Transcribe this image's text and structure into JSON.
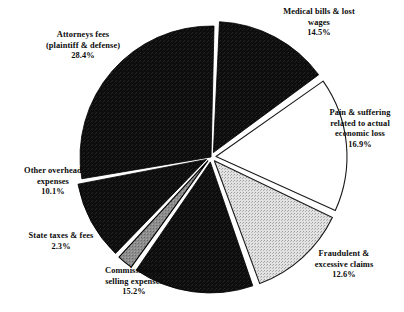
{
  "chart_data": {
    "type": "pie",
    "title": "",
    "subtitle": "",
    "xlabel": "",
    "ylabel": "",
    "legend_position": "none",
    "grid": false,
    "units": "percent",
    "total": 100.0,
    "categories": [
      "Medical bills & lost wages",
      "Pain & suffering related to actual economic loss",
      "Fraudulent & excessive claims",
      "Commissions & selling expenses",
      "State taxes & fees",
      "Other overhead expenses",
      "Attorneys fees (plaintiff & defense)"
    ],
    "values": [
      14.5,
      16.9,
      12.6,
      15.2,
      2.3,
      10.1,
      28.4
    ],
    "slices": [
      {
        "key": "medical",
        "label_lines": [
          "Medical bills & lost",
          "wages"
        ],
        "value_text": "14.5%",
        "value": 14.5,
        "fill_style": "black",
        "fill": "#0d0d0d",
        "stroke": "#000000",
        "exploded": true
      },
      {
        "key": "pain",
        "label_lines": [
          "Pain & suffering",
          "related to actual",
          "economic loss"
        ],
        "value_text": "16.9%",
        "value": 16.9,
        "fill_style": "white",
        "fill": "#ffffff",
        "stroke": "#1a1a1a",
        "exploded": true
      },
      {
        "key": "fraudulent",
        "label_lines": [
          "Fraudulent &",
          "excessive claims"
        ],
        "value_text": "12.6%",
        "value": 12.6,
        "fill_style": "light-stipple",
        "fill": "#dcdcdc",
        "stroke": "#1a1a1a",
        "exploded": true
      },
      {
        "key": "commissions",
        "label_lines": [
          "Commissions &",
          "selling expenses"
        ],
        "value_text": "15.2%",
        "value": 15.2,
        "fill_style": "black",
        "fill": "#0d0d0d",
        "stroke": "#000000",
        "exploded": true
      },
      {
        "key": "state-taxes",
        "label_lines": [
          "State taxes & fees"
        ],
        "value_text": "2.3%",
        "value": 2.3,
        "fill_style": "gray-stipple",
        "fill": "#8a8a8a",
        "stroke": "#000000",
        "exploded": true
      },
      {
        "key": "overhead",
        "label_lines": [
          "Other overhead",
          "expenses"
        ],
        "value_text": "10.1%",
        "value": 10.1,
        "fill_style": "black",
        "fill": "#0d0d0d",
        "stroke": "#000000",
        "exploded": true
      },
      {
        "key": "attorneys",
        "label_lines": [
          "Attorneys fees",
          "(plaintiff & defense)"
        ],
        "value_text": "28.4%",
        "value": 28.4,
        "fill_style": "black",
        "fill": "#0d0d0d",
        "stroke": "#000000",
        "exploded": false
      }
    ],
    "geometry": {
      "center_x": 211,
      "center_y": 157,
      "radius": 131,
      "start_angle_deg": -88,
      "explode_offset": 5
    },
    "colors": {
      "background": "#ffffff",
      "text": "#0b0b0b",
      "dark_fill": "#0d0d0d",
      "light_fill": "#dcdcdc",
      "gray_fill": "#8a8a8a",
      "outline": "#000000"
    }
  },
  "labels": {
    "medical": {
      "l1": "Medical bills & lost",
      "l2": "wages",
      "pct": "14.5%"
    },
    "pain": {
      "l1": "Pain & suffering",
      "l2": "related to actual",
      "l3": "economic loss",
      "pct": "16.9%"
    },
    "fraudulent": {
      "l1": "Fraudulent &",
      "l2": "excessive claims",
      "pct": "12.6%"
    },
    "commissions": {
      "l1": "Commissions &",
      "l2": "selling expenses",
      "pct": "15.2%"
    },
    "state_taxes": {
      "l1": "State taxes & fees",
      "pct": "2.3%"
    },
    "overhead": {
      "l1": "Other overhead",
      "l2": "expenses",
      "pct": "10.1%"
    },
    "attorneys": {
      "l1": "Attorneys fees",
      "l2": "(plaintiff & defense)",
      "pct": "28.4%"
    }
  }
}
